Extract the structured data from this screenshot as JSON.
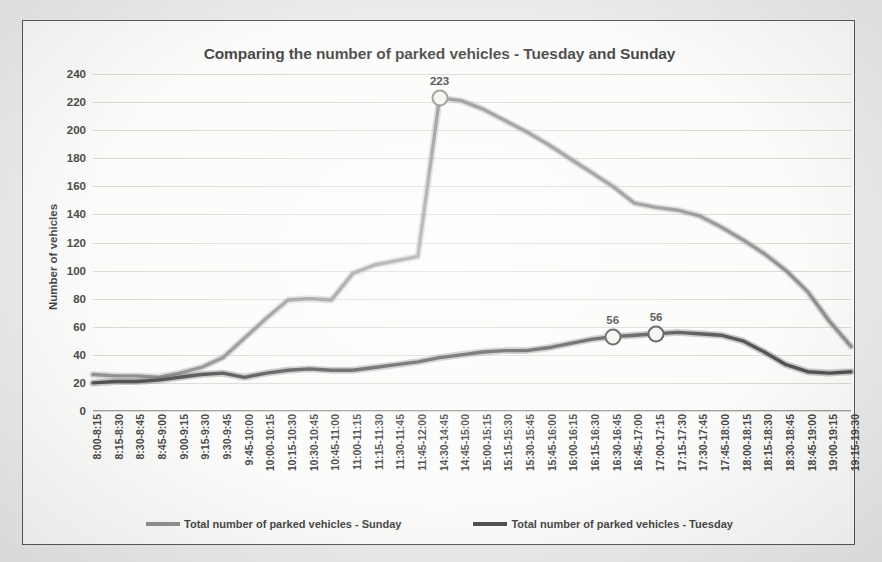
{
  "chart_data": {
    "type": "line",
    "title": "Comparing the number of parked vehicles - Tuesday and Sunday",
    "xlabel": "",
    "ylabel": "Number of vehicles",
    "ylim": [
      0,
      240
    ],
    "ytick_step": 20,
    "yticks": [
      "240",
      "220",
      "200",
      "180",
      "160",
      "140",
      "120",
      "100",
      "80",
      "60",
      "40",
      "20",
      "0"
    ],
    "grid": true,
    "legend_position": "bottom",
    "categories": [
      "8:00-8:15",
      "8:15-8:30",
      "8:30-8:45",
      "8:45-9:00",
      "9:00-9:15",
      "9:15-9:30",
      "9:30-9:45",
      "9:45-10:00",
      "10:00-10:15",
      "10:15-10:30",
      "10:30-10:45",
      "10:45-11:00",
      "11:00-11:15",
      "11:15-11:30",
      "11:30-11:45",
      "11:45-12:00",
      "14:30-14:45",
      "14:45-15:00",
      "15:00-15:15",
      "15:15-15:30",
      "15:30-15:45",
      "15:45-16:00",
      "16:00-16:15",
      "16:15-16:30",
      "16:30-16:45",
      "16:45-17:00",
      "17:00-17:15",
      "17:15-17:30",
      "17:30-17:45",
      "17:45-18:00",
      "18:00-18:15",
      "18:15-18:30",
      "18:30-18:45",
      "18:45-19:00",
      "19:00-19:15",
      "19:15-19:30"
    ],
    "series": [
      {
        "name": "Total number of parked vehicles - Sunday",
        "color": "#7b7b79",
        "values": [
          26,
          25,
          25,
          24,
          27,
          31,
          38,
          52,
          66,
          79,
          80,
          79,
          98,
          104,
          107,
          110,
          223,
          221,
          215,
          207,
          199,
          190,
          180,
          170,
          160,
          148,
          145,
          143,
          139,
          131,
          122,
          112,
          100,
          85,
          64,
          46
        ]
      },
      {
        "name": "Total number of parked vehicles - Tuesday",
        "color": "#2f2f2f",
        "values": [
          20,
          21,
          21,
          22,
          24,
          26,
          27,
          24,
          27,
          29,
          30,
          29,
          29,
          31,
          33,
          35,
          38,
          40,
          42,
          43,
          43,
          45,
          48,
          51,
          53,
          54,
          55,
          56,
          55,
          54,
          50,
          42,
          33,
          28,
          27,
          28
        ]
      }
    ],
    "data_labels": [
      {
        "series": "Total number of parked vehicles - Sunday",
        "category": "14:30-14:45",
        "value": 223,
        "text": "223"
      },
      {
        "series": "Total number of parked vehicles - Tuesday",
        "category": "16:30-16:45",
        "value": 53,
        "text": "56"
      },
      {
        "series": "Total number of parked vehicles - Tuesday",
        "category": "17:00-17:15",
        "value": 55,
        "text": "56"
      }
    ]
  },
  "legend": {
    "items": [
      {
        "label": "Total number of parked vehicles - Sunday"
      },
      {
        "label": "Total number of parked vehicles - Tuesday"
      }
    ]
  }
}
